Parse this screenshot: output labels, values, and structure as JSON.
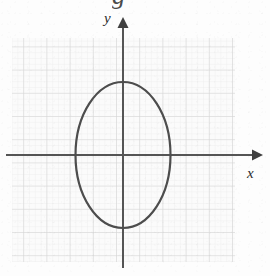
{
  "figure": {
    "kind": "coordinate-plane-ellipse-graph",
    "background_color": "#fdfdfd",
    "scan_quality_note": "faded photocopy / textbook scan"
  },
  "cut_text": {
    "glyph": "g",
    "note": "descender of truncated caption line at top edge"
  },
  "grid": {
    "left": 12,
    "top": 38,
    "right": 235,
    "bottom": 262,
    "minor_step": 5.8,
    "major_step": 23.2,
    "minor_color": "#e6e6e6",
    "major_color": "#d2d2d2",
    "fill_color": "#fafafa",
    "show": true
  },
  "axes": {
    "color": "#555555",
    "stroke_width": 2.0,
    "origin_x": 123,
    "origin_y": 155,
    "x_axis": {
      "label": "x",
      "label_x": 247,
      "label_y": 166,
      "font_size": 15,
      "start_x": 6,
      "end_x": 258,
      "arrow": "right"
    },
    "y_axis": {
      "label": "y",
      "label_x": 104,
      "label_y": 11,
      "font_size": 15,
      "start_y": 268,
      "end_y": 20,
      "arrow": "up"
    }
  },
  "chart_data": {
    "type": "line",
    "title": "",
    "subtitle": "",
    "xlabel": "x",
    "ylabel": "y",
    "curves": [
      {
        "name": "ellipse",
        "shape": "ellipse",
        "center_x": 0,
        "center_y": 0,
        "semi_axis_x_px": 47.5,
        "semi_axis_y_px": 73.0,
        "semi_axis_x_units": 2,
        "semi_axis_y_units": 3,
        "orientation": "vertical-major-axis",
        "stroke_color": "#4d4d4d",
        "stroke_width": 2.2,
        "fill": "none",
        "closed": true,
        "x_intercepts": [
          -2,
          2
        ],
        "y_intercepts": [
          -3,
          3
        ],
        "px_left": 75.5,
        "px_right": 170.5,
        "px_top": 82,
        "px_bottom": 228
      }
    ],
    "legend": null,
    "legend_position": "none",
    "grid": true,
    "xlim_units": [
      -4.8,
      4.8
    ],
    "ylim_units": [
      -4.4,
      4.8
    ],
    "annotations": []
  }
}
